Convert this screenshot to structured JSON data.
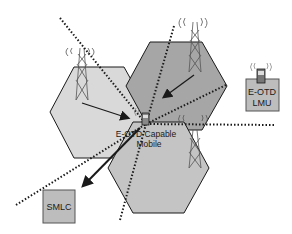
{
  "diagram": {
    "labels": {
      "mobile_line1": "E-OTD Capable",
      "mobile_line2": "Mobile",
      "lmu_line1": "E-OTD",
      "lmu_line2": "LMU",
      "smlc": "SMLC"
    },
    "cells": [
      {
        "name": "left-cell",
        "fill": "#d9d9d9"
      },
      {
        "name": "top-right-cell",
        "fill": "#a6a6a6"
      },
      {
        "name": "bottom-cell",
        "fill": "#c4c4c4"
      }
    ],
    "colors": {
      "stroke": "#1a1a1a",
      "box_fill": "#bdbdbd",
      "dotted": "#1a1a1a"
    }
  }
}
